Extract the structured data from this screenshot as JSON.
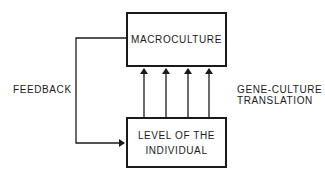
{
  "diagram": {
    "nodes": {
      "top": {
        "label": "MACROCULTURE"
      },
      "bottom": {
        "label": "LEVEL OF THE\nINDIVIDUAL"
      }
    },
    "edges": {
      "feedback": {
        "label": "FEEDBACK",
        "from": "MACROCULTURE",
        "to": "LEVEL OF THE INDIVIDUAL",
        "count": 1
      },
      "translation": {
        "label": "GENE-CULTURE\nTRANSLATION",
        "from": "LEVEL OF THE INDIVIDUAL",
        "to": "MACROCULTURE",
        "count": 4
      }
    },
    "colors": {
      "line": "#1a1a1a",
      "background": "#ffffff"
    }
  }
}
